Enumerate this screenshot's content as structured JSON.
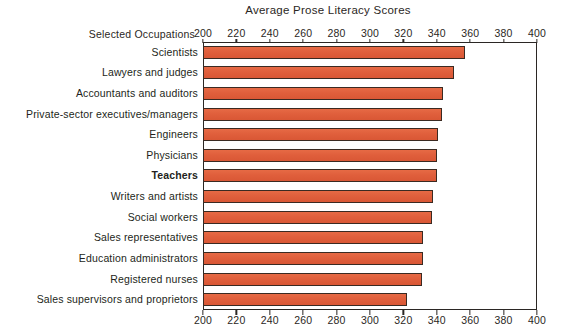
{
  "chart_data": {
    "type": "bar",
    "orientation": "horizontal",
    "title": "Average Prose Literacy Scores",
    "xlabel": "",
    "ylabel": "Selected Occupations",
    "xlim": [
      200,
      400
    ],
    "grid": false,
    "legend": null,
    "xticks": [
      200,
      220,
      240,
      260,
      280,
      300,
      320,
      340,
      360,
      380,
      400
    ],
    "xtick_labels": [
      "200",
      "220",
      "240",
      "260",
      "280",
      "300",
      "320",
      "340",
      "360",
      "380",
      "400"
    ],
    "bar_color": "#e2603e",
    "bar_edge_color": "#3a2a22",
    "categories": [
      "Scientists",
      "Lawyers and judges",
      "Accountants and auditors",
      "Private-sector executives/managers",
      "Engineers",
      "Physicians",
      "Teachers",
      "Writers and artists",
      "Social workers",
      "Sales representatives",
      "Education administrators",
      "Registered nurses",
      "Sales supervisors and proprietors"
    ],
    "values": [
      357,
      350,
      344,
      343,
      341,
      340,
      340,
      338,
      337,
      332,
      332,
      331,
      322
    ],
    "highlighted_category": "Teachers"
  },
  "axis_caption": "Selected Occupations"
}
